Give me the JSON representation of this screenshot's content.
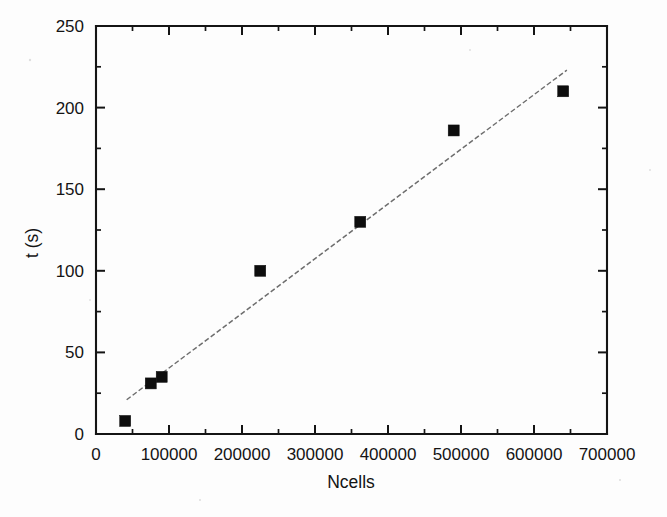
{
  "chart_data": {
    "type": "scatter",
    "title": "",
    "subtitle": "",
    "xlabel": "Ncells",
    "ylabel": "t (s)",
    "xlim": [
      0,
      700000
    ],
    "ylim": [
      0,
      250
    ],
    "grid": false,
    "legend": null,
    "legend_position": "none",
    "x_ticks": [
      0,
      100000,
      200000,
      300000,
      400000,
      500000,
      600000,
      700000
    ],
    "x_tick_labels": [
      "0",
      "100000",
      "200000",
      "300000",
      "400000",
      "500000",
      "600000",
      "700000"
    ],
    "x_minor_tick_step": 50000,
    "y_ticks": [
      0,
      50,
      100,
      150,
      200,
      250
    ],
    "y_tick_labels": [
      "0",
      "50",
      "100",
      "150",
      "200",
      "250"
    ],
    "y_minor_tick_step": 25,
    "marker_style": "filled-square",
    "marker_color": "#0d0d0d",
    "series": [
      {
        "name": "measured runtime",
        "type": "scatter",
        "points": [
          {
            "x": 40000,
            "y": 8
          },
          {
            "x": 75000,
            "y": 31
          },
          {
            "x": 90000,
            "y": 35
          },
          {
            "x": 225000,
            "y": 100
          },
          {
            "x": 362000,
            "y": 130
          },
          {
            "x": 490000,
            "y": 186
          },
          {
            "x": 640000,
            "y": 210
          }
        ]
      },
      {
        "name": "linear fit",
        "type": "line",
        "line_style": "dashed",
        "line_color": "#6e6e6e",
        "points": [
          {
            "x": 42000,
            "y": 21
          },
          {
            "x": 645000,
            "y": 223
          }
        ]
      }
    ]
  },
  "axes": {
    "x_axis_name": "Ncells",
    "y_axis_name": "t (s)"
  },
  "figure": {
    "background_color": "#fdfdfd",
    "frame_color": "#141414"
  }
}
